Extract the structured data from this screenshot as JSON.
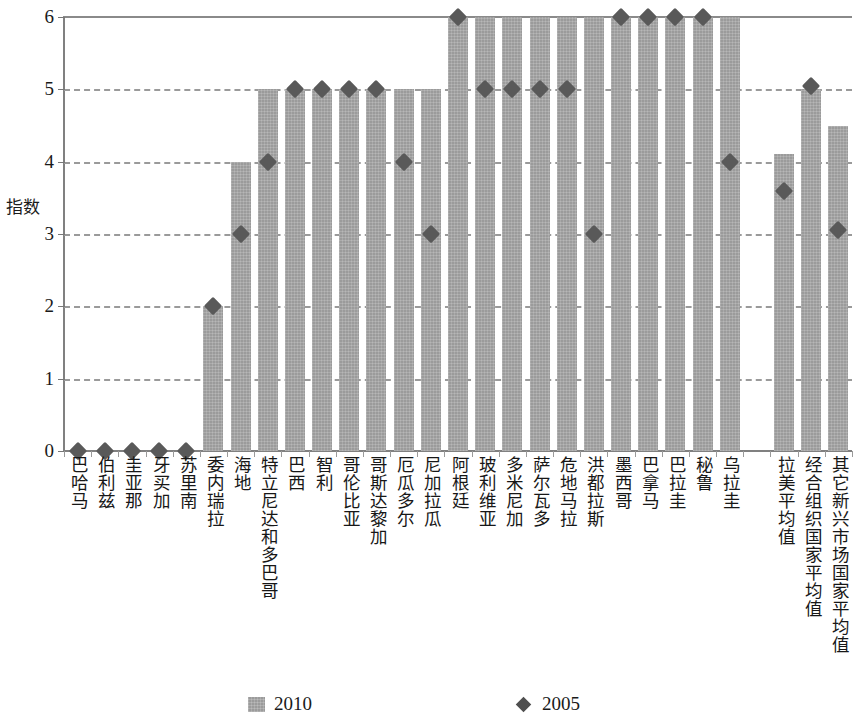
{
  "chart_data": {
    "type": "bar",
    "title": "",
    "subtitle": "",
    "xlabel": "",
    "ylabel": "指数",
    "ylim": [
      0,
      6
    ],
    "yticks": [
      0,
      1,
      2,
      3,
      4,
      5,
      6
    ],
    "ytick_labels": [
      "0",
      "1",
      "2",
      "3",
      "4",
      "5",
      "6"
    ],
    "grid": true,
    "grid_axis": "y",
    "legend_position": "bottom",
    "categories": [
      "巴哈马",
      "伯利兹",
      "圭亚那",
      "牙买加",
      "苏里南",
      "委内瑞拉",
      "海地",
      "特立尼达和多巴哥",
      "巴西",
      "智利",
      "哥伦比亚",
      "哥斯达黎加",
      "厄瓜多尔",
      "尼加拉瓜",
      "阿根廷",
      "玻利维亚",
      "多米尼加",
      "萨尔瓦多",
      "危地马拉",
      "洪都拉斯",
      "墨西哥",
      "巴拿马",
      "巴拉圭",
      "秘鲁",
      "乌拉圭",
      "",
      "拉美平均值",
      "经合组织国家平均值",
      "其它新兴市场国家平均值"
    ],
    "series": [
      {
        "name": "2010",
        "type": "bar",
        "color": "#9b9b9b",
        "values": [
          0,
          0,
          0,
          0,
          0,
          2.0,
          4.0,
          5.0,
          5.0,
          5.0,
          5.0,
          5.0,
          5.0,
          5.0,
          6.0,
          6.0,
          6.0,
          6.0,
          6.0,
          6.0,
          6.0,
          6.0,
          6.0,
          6.0,
          6.0,
          null,
          4.1,
          5.0,
          4.5
        ]
      },
      {
        "name": "2005",
        "type": "scatter",
        "marker": "diamond",
        "color": "#595959",
        "values": [
          0,
          0,
          0,
          0,
          0,
          2.0,
          3.0,
          4.0,
          5.0,
          5.0,
          5.0,
          5.0,
          4.0,
          3.0,
          6.0,
          5.0,
          5.0,
          5.0,
          5.0,
          3.0,
          6.0,
          6.0,
          6.0,
          6.0,
          4.0,
          null,
          3.6,
          5.05,
          3.05
        ]
      }
    ],
    "legend_entries": [
      {
        "label": "2010",
        "marker": "bar",
        "color": "#9b9b9b"
      },
      {
        "label": "2005",
        "marker": "diamond",
        "color": "#4f4f4f"
      }
    ],
    "colors": {
      "bar": "#9b9b9b",
      "marker": "#595959",
      "grid": "#9a9a9a",
      "axis": "#808080",
      "text": "#171717",
      "background": "#ffffff"
    }
  }
}
